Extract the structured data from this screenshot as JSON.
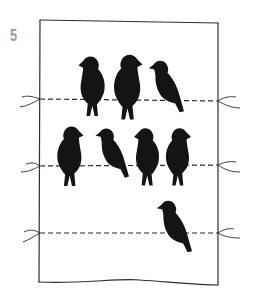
{
  "step": {
    "number": "5"
  },
  "illustration": {
    "description": "Hand-drawn rectangular frame with three dashed wires strung across, birds perched on them",
    "colors": {
      "ink": "#1a1a1a",
      "frame": "#3a3a3a",
      "step_number": "#9a9a9a",
      "background": "#ffffff"
    },
    "wires": [
      {
        "row": 1,
        "y": 100,
        "bird_count": 3
      },
      {
        "row": 2,
        "y": 165,
        "bird_count": 4
      },
      {
        "row": 3,
        "y": 232,
        "bird_count": 1
      }
    ],
    "total_birds": 8
  }
}
